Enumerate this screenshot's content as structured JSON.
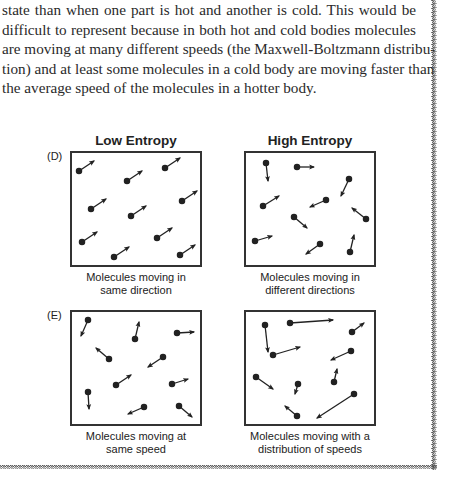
{
  "paragraph": {
    "lines": [
      "state than when one part is hot and another is cold. This would be",
      "difficult to represent because in both hot and cold bodies molecules",
      "are moving at many different speeds (the Maxwell-Boltzmann distribu-",
      "tion) and at least some molecules in a cold body are moving faster than",
      "the average speed of the molecules in a hotter body."
    ]
  },
  "figure": {
    "column_titles": [
      "Low Entropy",
      "High Entropy"
    ],
    "rows": [
      {
        "label": "(D)",
        "panels": [
          {
            "caption": [
              "Molecules moving in",
              "same direction"
            ]
          },
          {
            "caption": [
              "Molecules moving in",
              "different directions"
            ]
          }
        ]
      },
      {
        "label": "(E)",
        "panels": [
          {
            "caption": [
              "Molecules moving at",
              "same speed"
            ]
          },
          {
            "caption": [
              "Molecules moving with a",
              "distribution of speeds"
            ]
          }
        ]
      }
    ]
  },
  "colors": {
    "ink": "#222222",
    "box_border": "#333333",
    "text": "#2a2a2a"
  }
}
